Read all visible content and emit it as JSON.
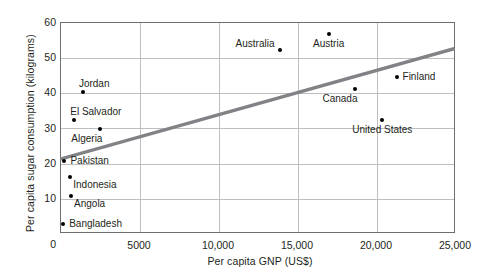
{
  "chart_data": {
    "type": "scatter",
    "title": "",
    "xlabel": "Per capita GNP (US$)",
    "ylabel": "Per capita sugar consumption (kilograms)",
    "xlim": [
      0,
      25000
    ],
    "ylim": [
      0,
      60
    ],
    "xticks": [
      "0",
      "5000",
      "10,000",
      "15,000",
      "20,000",
      "25,000"
    ],
    "xtick_values": [
      0,
      5000,
      10000,
      15000,
      20000,
      25000
    ],
    "yticks": [
      "0",
      "10",
      "20",
      "30",
      "40",
      "50",
      "60"
    ],
    "ytick_values": [
      0,
      10,
      20,
      30,
      40,
      50,
      60
    ],
    "grid": true,
    "legend": "none",
    "points": [
      {
        "label": "Australia",
        "x": 13900,
        "y": 52,
        "label_pos": "left"
      },
      {
        "label": "Austria",
        "x": 17000,
        "y": 56.5,
        "label_pos": "below"
      },
      {
        "label": "Finland",
        "x": 21300,
        "y": 44.5,
        "label_pos": "right"
      },
      {
        "label": "Canada",
        "x": 18700,
        "y": 41,
        "label_pos": "below-left"
      },
      {
        "label": "United States",
        "x": 20400,
        "y": 32,
        "label_pos": "below"
      },
      {
        "label": "Jordan",
        "x": 1450,
        "y": 40,
        "label_pos": "above-right"
      },
      {
        "label": "El Salvador",
        "x": 900,
        "y": 32,
        "label_pos": "above-right"
      },
      {
        "label": "Algeria",
        "x": 2550,
        "y": 29.5,
        "label_pos": "below-left"
      },
      {
        "label": "Pakistan",
        "x": 280,
        "y": 20.5,
        "label_pos": "right"
      },
      {
        "label": "Indonesia",
        "x": 650,
        "y": 16,
        "label_pos": "below-right"
      },
      {
        "label": "Angola",
        "x": 700,
        "y": 10.5,
        "label_pos": "below-right"
      },
      {
        "label": "Bangladesh",
        "x": 200,
        "y": 2.5,
        "label_pos": "right"
      }
    ],
    "trend_line": {
      "x_start": 0,
      "y_start": 21,
      "x_end": 25000,
      "y_end": 52.5,
      "color": "#808285",
      "width": 3
    },
    "colors": {
      "point": "#000000",
      "grid": "#bcbec0",
      "frame": "#6d6e71",
      "text": "#231f20",
      "background": "#ffffff"
    }
  }
}
